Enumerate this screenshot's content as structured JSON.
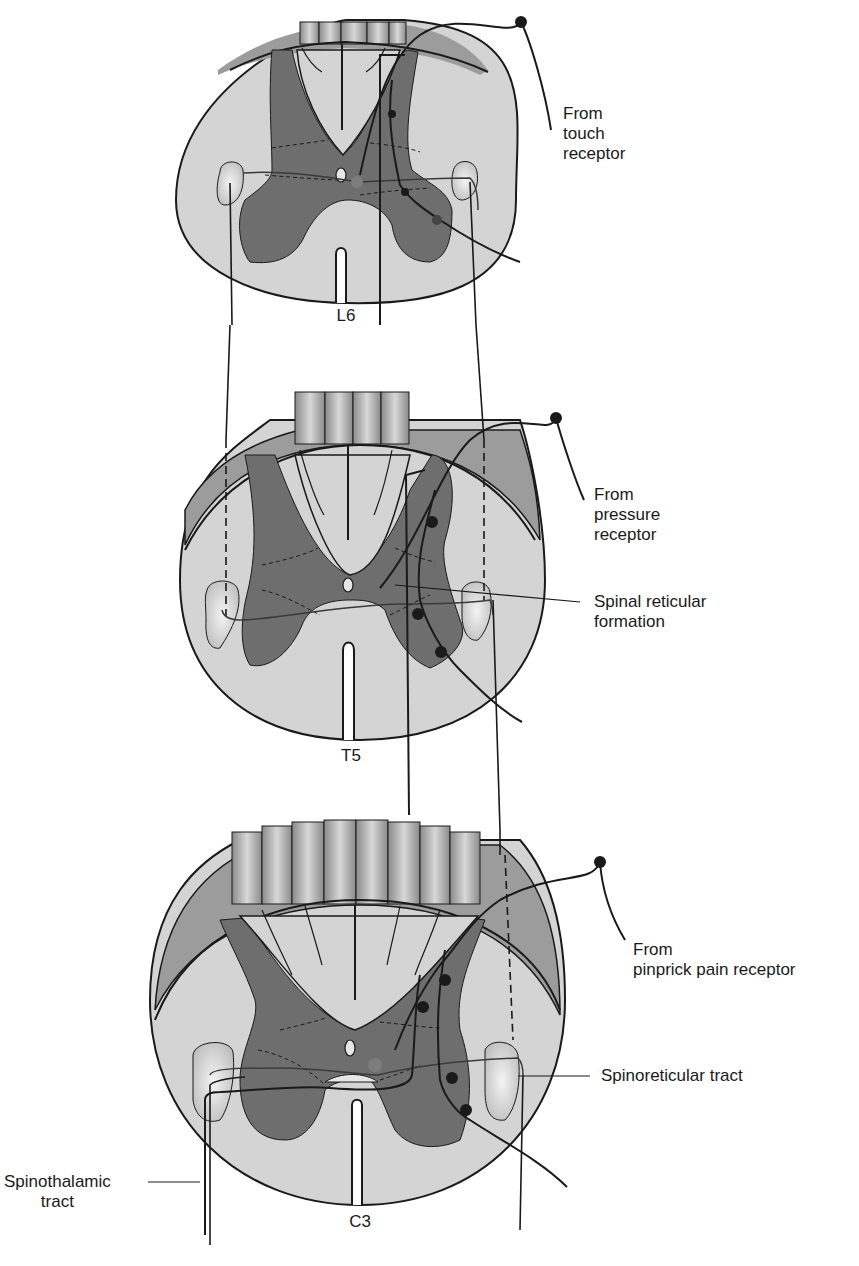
{
  "figure": {
    "colors": {
      "white_matter": "#d4d4d4",
      "white_matter_shade": "#9c9c9c",
      "gray_matter": "#6e6e6e",
      "dorsal_column": "#c9c9c9",
      "nerve_fiber": "#1e1e1e",
      "tract_fill": "#e6e6e6",
      "background": "#ffffff"
    },
    "segments": [
      {
        "id": "L6",
        "label": "L6"
      },
      {
        "id": "T5",
        "label": "T5"
      },
      {
        "id": "C3",
        "label": "C3"
      }
    ],
    "labels": {
      "touch": [
        "From",
        "touch",
        "receptor"
      ],
      "pressure": [
        "From",
        "pressure",
        "receptor"
      ],
      "reticular_formation": [
        "Spinal reticular",
        "formation"
      ],
      "pinprick": [
        "From",
        "pinprick pain receptor"
      ],
      "spinoreticular": [
        "Spinoreticular tract"
      ],
      "spinothalamic": [
        "Spinothalamic",
        "tract"
      ]
    }
  }
}
